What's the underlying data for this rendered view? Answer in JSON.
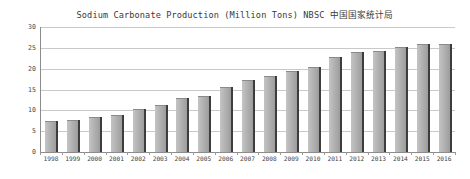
{
  "chart_data": {
    "type": "bar",
    "title": "Sodium Carbonate Production (Million Tons) NBSC 中国国家统计局",
    "xlabel": "",
    "ylabel": "",
    "ylim": [
      0,
      30
    ],
    "ytick_labels": [
      "30",
      "25",
      "20",
      "15",
      "10",
      "5",
      "0"
    ],
    "ytick_values": [
      30,
      25,
      20,
      15,
      10,
      5,
      0
    ],
    "grid": true,
    "legend": "none",
    "bar_color": "#b4b4b4",
    "bar_edge_color": "#3d3d3d",
    "grid_color": "#c9c9c9",
    "axis_color": "#8c8c8c",
    "categories": [
      "1998",
      "1999",
      "2000",
      "2001",
      "2002",
      "2003",
      "2004",
      "2005",
      "2006",
      "2007",
      "2008",
      "2009",
      "2010",
      "2011",
      "2012",
      "2013",
      "2014",
      "2015",
      "2016"
    ],
    "values": [
      7.5,
      7.8,
      8.3,
      9.0,
      10.3,
      11.3,
      13.0,
      13.5,
      15.7,
      17.3,
      18.2,
      19.4,
      20.3,
      22.9,
      24.0,
      24.3,
      25.3,
      26.0,
      25.9
    ]
  }
}
